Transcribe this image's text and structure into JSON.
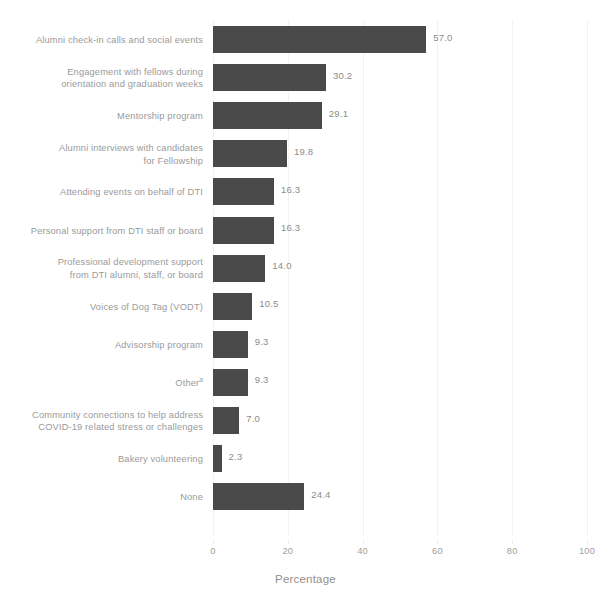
{
  "chart_data": {
    "type": "bar",
    "orientation": "horizontal",
    "title": "",
    "xlabel": "Percentage",
    "ylabel": "",
    "xlim": [
      0,
      100
    ],
    "xticks": [
      0,
      20,
      40,
      60,
      80,
      100
    ],
    "xtick_labels": [
      "0",
      "20",
      "40",
      "60",
      "80",
      "100"
    ],
    "grid": false,
    "legend": false,
    "bar_color": "#4a4a4a",
    "label_color": "#9a9a9a",
    "categories": [
      "Alumni check-in calls and social events",
      "Engagement with fellows during\norientation and graduation weeks",
      "Mentorship program",
      "Alumni interviews with candidates\nfor Fellowship",
      "Attending events on behalf of DTI",
      "Personal support from DTI staff or board",
      "Professional development support\nfrom DTI alumni, staff, or board",
      "Voices of Dog Tag (VODT)",
      "Advisorship program",
      "Other",
      "Community connections to help address\nCOVID-19 related stress or challenges",
      "Bakery volunteering",
      "None"
    ],
    "category_footnote_marks": [
      "",
      "",
      "",
      "",
      "",
      "",
      "",
      "",
      "",
      "a",
      "",
      "",
      ""
    ],
    "values": [
      57.0,
      30.2,
      29.1,
      19.8,
      16.3,
      16.3,
      14.0,
      10.5,
      9.3,
      9.3,
      7.0,
      2.3,
      24.4
    ],
    "value_labels": [
      "57.0",
      "30.2",
      "29.1",
      "19.8",
      "16.3",
      "16.3",
      "14.0",
      "10.5",
      "9.3",
      "9.3",
      "7.0",
      "2.3",
      "24.4"
    ]
  }
}
